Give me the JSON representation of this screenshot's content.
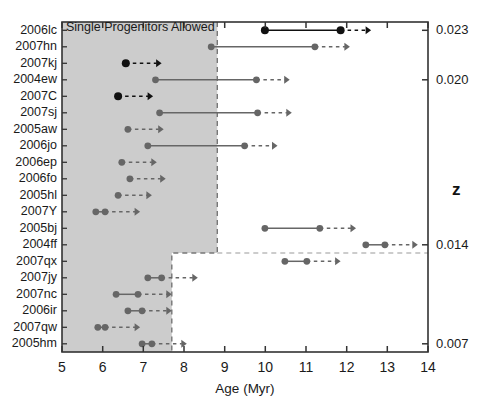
{
  "chart_data": {
    "type": "scatter",
    "title": "Single Progenitors Allowed",
    "xlabel": "Age (Myr)",
    "ylabel": "",
    "right_axis_label": "z",
    "xlim": [
      5,
      14
    ],
    "xticks": [
      5,
      6,
      7,
      8,
      9,
      10,
      11,
      12,
      13,
      14
    ],
    "xticklabels": [
      "5",
      "6",
      "7",
      "8",
      "9",
      "10",
      "11",
      "12",
      "13",
      "14"
    ],
    "grid": false,
    "legend": "none",
    "right_axis_ticks": [
      0.023,
      0.02,
      0.014,
      0.007
    ],
    "right_axis_ticklabels": [
      "0.023",
      "0.020",
      "0.014",
      "0.007"
    ],
    "right_axis_tick_rows": [
      0,
      3,
      13,
      19
    ],
    "categories": [
      "2006lc",
      "2007hn",
      "2007kj",
      "2004ew",
      "2007C",
      "2007sj",
      "2005aw",
      "2006jo",
      "2006ep",
      "2006fo",
      "2005hl",
      "2007Y",
      "2005bj",
      "2004ff",
      "2007qx",
      "2007jy",
      "2007nc",
      "2006ir",
      "2007qw",
      "2005hm"
    ],
    "shaded_region": {
      "label": "Single Progenitors Allowed",
      "color": "#cccccc",
      "border": "dashed",
      "upper_x_max": 8.82,
      "upper_rows": [
        0,
        13
      ],
      "lower_x_max": 7.7,
      "lower_rows": [
        14,
        19
      ]
    },
    "series": [
      {
        "name": "2006lc",
        "age_min": 9.99,
        "age_max": 11.85,
        "arrow_to": 12.6,
        "marker": "dark",
        "connector": "solid"
      },
      {
        "name": "2007hn",
        "age_min": 8.67,
        "age_max": 11.22,
        "arrow_to": 12.08,
        "marker": "medium",
        "connector": "solid"
      },
      {
        "name": "2007kj",
        "age_min": 6.57,
        "age_max": 6.57,
        "arrow_to": 7.45,
        "marker": "dark",
        "connector": "none"
      },
      {
        "name": "2004ew",
        "age_min": 7.3,
        "age_max": 9.78,
        "arrow_to": 10.6,
        "marker": "medium",
        "connector": "solid"
      },
      {
        "name": "2007C",
        "age_min": 6.38,
        "age_max": 6.38,
        "arrow_to": 7.24,
        "marker": "dark",
        "connector": "none"
      },
      {
        "name": "2007sj",
        "age_min": 7.4,
        "age_max": 9.81,
        "arrow_to": 10.65,
        "marker": "medium",
        "connector": "solid"
      },
      {
        "name": "2005aw",
        "age_min": 6.62,
        "age_max": 6.62,
        "arrow_to": 7.5,
        "marker": "medium",
        "connector": "none"
      },
      {
        "name": "2006jo",
        "age_min": 7.11,
        "age_max": 9.49,
        "arrow_to": 10.3,
        "marker": "medium",
        "connector": "solid"
      },
      {
        "name": "2006ep",
        "age_min": 6.47,
        "age_max": 6.47,
        "arrow_to": 7.33,
        "marker": "medium",
        "connector": "none"
      },
      {
        "name": "2006fo",
        "age_min": 6.67,
        "age_max": 6.67,
        "arrow_to": 7.55,
        "marker": "medium",
        "connector": "none"
      },
      {
        "name": "2005hl",
        "age_min": 6.38,
        "age_max": 6.38,
        "arrow_to": 7.21,
        "marker": "medium",
        "connector": "none"
      },
      {
        "name": "2007Y",
        "age_min": 5.83,
        "age_max": 6.06,
        "arrow_to": 6.92,
        "marker": "medium",
        "connector": "solid"
      },
      {
        "name": "2005bj",
        "age_min": 9.99,
        "age_max": 11.34,
        "arrow_to": 12.23,
        "marker": "medium",
        "connector": "solid"
      },
      {
        "name": "2004ff",
        "age_min": 12.47,
        "age_max": 12.94,
        "arrow_to": 13.75,
        "marker": "medium",
        "connector": "solid"
      },
      {
        "name": "2007qx",
        "age_min": 10.48,
        "age_max": 11.02,
        "arrow_to": 11.85,
        "marker": "medium",
        "connector": "solid"
      },
      {
        "name": "2007jy",
        "age_min": 7.11,
        "age_max": 7.45,
        "arrow_to": 8.34,
        "marker": "medium",
        "connector": "solid"
      },
      {
        "name": "2007nc",
        "age_min": 6.33,
        "age_max": 6.87,
        "arrow_to": 7.7,
        "marker": "medium",
        "connector": "solid"
      },
      {
        "name": "2006ir",
        "age_min": 6.62,
        "age_max": 6.97,
        "arrow_to": 7.7,
        "marker": "medium",
        "connector": "solid"
      },
      {
        "name": "2007qw",
        "age_min": 5.88,
        "age_max": 6.06,
        "arrow_to": 6.92,
        "marker": "medium",
        "connector": "solid"
      },
      {
        "name": "2005hm",
        "age_min": 6.97,
        "age_max": 7.21,
        "arrow_to": 8.07,
        "marker": "medium",
        "connector": "solid"
      }
    ],
    "colors": {
      "dark_marker": "#111111",
      "medium_marker": "#666666",
      "shade": "#cccccc",
      "axis": "#333333"
    }
  }
}
